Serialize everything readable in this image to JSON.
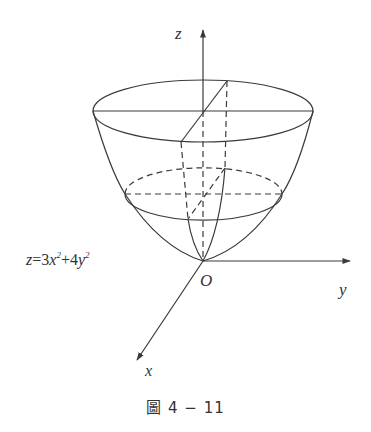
{
  "figure": {
    "labels": {
      "z_axis": "z",
      "y_axis": "y",
      "x_axis": "x",
      "origin": "O"
    },
    "equation": {
      "lhs": "z",
      "eq": "=",
      "term1_coef": "3",
      "term1_var": "x",
      "term1_exp": "2",
      "plus": "+",
      "term2_coef": "4",
      "term2_var": "y",
      "term2_exp": "2"
    },
    "caption": "圖 4 − 11",
    "colors": {
      "line": "#3a3a3a",
      "background": "#ffffff"
    }
  }
}
